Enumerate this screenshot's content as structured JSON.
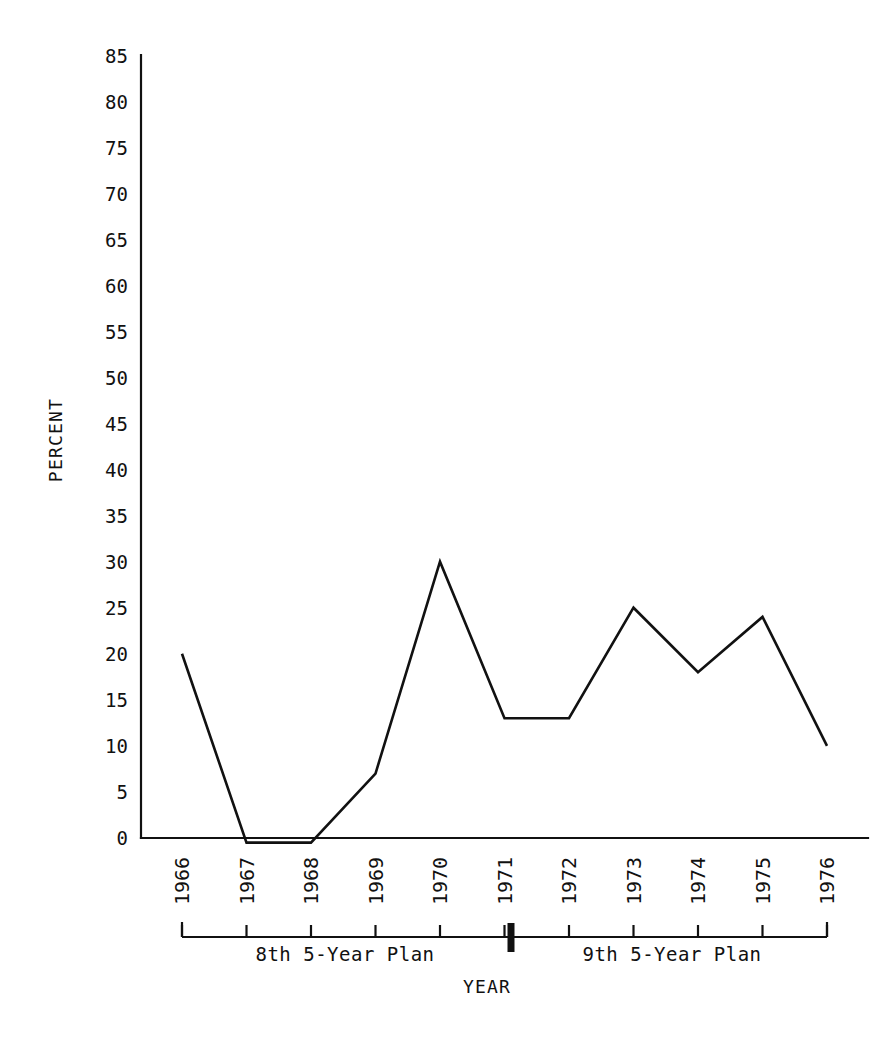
{
  "chart_data": {
    "type": "line",
    "title": "",
    "xlabel": "YEAR",
    "ylabel": "PERCENT",
    "categories": [
      "1966",
      "1967",
      "1968",
      "1969",
      "1970",
      "1971",
      "1972",
      "1973",
      "1974",
      "1975",
      "1976"
    ],
    "values": [
      20,
      -0.5,
      -0.5,
      7,
      30,
      13,
      13,
      25,
      18,
      24,
      10
    ],
    "ylim": [
      0,
      85
    ],
    "yticks": [
      0,
      5,
      10,
      15,
      20,
      25,
      30,
      35,
      40,
      45,
      50,
      55,
      60,
      65,
      70,
      75,
      80,
      85
    ],
    "ytick_labels": [
      "0",
      "5",
      "10",
      "15",
      "20",
      "25",
      "30",
      "35",
      "40",
      "45",
      "50",
      "55",
      "60",
      "65",
      "70",
      "75",
      "80",
      "85"
    ],
    "grid": false,
    "legend": "none",
    "line_color": "#111111",
    "background_color": "#ffffff",
    "annotations": [
      {
        "text": "8th 5-Year Plan",
        "span_start": "1966",
        "span_end": "1971"
      },
      {
        "text": "9th 5-Year Plan",
        "span_start": "1971",
        "span_end": "1976"
      }
    ]
  },
  "axes": {
    "y_title": "PERCENT",
    "x_title": "YEAR"
  },
  "plan_brackets": {
    "left_label": "8th 5-Year Plan",
    "right_label": "9th 5-Year Plan"
  }
}
